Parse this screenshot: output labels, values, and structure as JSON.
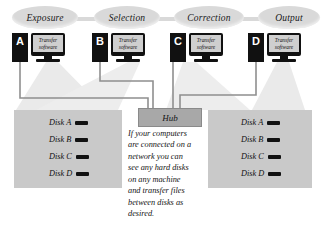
{
  "diagram": {
    "stages": [
      {
        "label": "Exposure"
      },
      {
        "label": "Selection"
      },
      {
        "label": "Correction"
      },
      {
        "label": "Output"
      }
    ],
    "computers": [
      {
        "letter": "A",
        "screen_line1": "Transfer",
        "screen_line2": "software"
      },
      {
        "letter": "B",
        "screen_line1": "Transfer",
        "screen_line2": "software"
      },
      {
        "letter": "C",
        "screen_line1": "Transfer",
        "screen_line2": "software"
      },
      {
        "letter": "D",
        "screen_line1": "Transfer",
        "screen_line2": "software"
      }
    ],
    "hub": {
      "label": "Hub"
    },
    "disk_panel_left": {
      "disks": [
        {
          "label": "Disk A"
        },
        {
          "label": "Disk B"
        },
        {
          "label": "Disk C"
        },
        {
          "label": "Disk D"
        }
      ]
    },
    "disk_panel_right": {
      "disks": [
        {
          "label": "Disk A"
        },
        {
          "label": "Disk B"
        },
        {
          "label": "Disk C"
        },
        {
          "label": "Disk D"
        }
      ]
    },
    "caption": {
      "lines": [
        "If your computers",
        "are connected on a",
        "network you can",
        "see any hard disks",
        "on any machine",
        "and transfer files",
        "between disks as",
        "desired."
      ]
    },
    "colors": {
      "pill": "#d9d9d9",
      "device_black": "#111111",
      "screen_grey": "#cfcfcf",
      "hub_grey": "#a8a8a8",
      "panel_grey": "#c9c9c9",
      "beam_grey": "#e9e9e9",
      "wire_grey": "#8f8f8f",
      "background": "#ffffff"
    }
  }
}
